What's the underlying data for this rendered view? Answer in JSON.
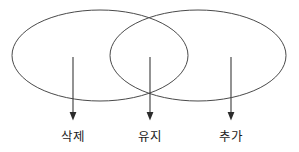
{
  "diagram": {
    "type": "venn-two-set",
    "background_color": "#ffffff",
    "stroke_color": "#4a4a4a",
    "label_color": "#1c1c1c",
    "sets": [
      {
        "id": "left-set",
        "name": "left-ellipse",
        "cx": 100,
        "cy": 55.5,
        "rx": 88,
        "ry": 45.5
      },
      {
        "id": "right-set",
        "name": "right-ellipse",
        "cx": 198,
        "cy": 55.5,
        "rx": 88,
        "ry": 45.5
      }
    ],
    "regions": [
      {
        "id": "left-only",
        "label": "삭제",
        "pointer_x": 73,
        "pointer_y_start": 57,
        "pointer_y_end": 120,
        "label_x": 73,
        "label_y": 141
      },
      {
        "id": "intersection",
        "label": "유지",
        "pointer_x": 150,
        "pointer_y_start": 57,
        "pointer_y_end": 120,
        "label_x": 150,
        "label_y": 141
      },
      {
        "id": "right-only",
        "label": "추가",
        "pointer_x": 231,
        "pointer_y_start": 57,
        "pointer_y_end": 120,
        "label_x": 231,
        "label_y": 141
      }
    ]
  }
}
